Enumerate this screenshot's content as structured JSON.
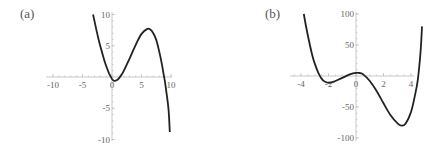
{
  "chart_data": [
    {
      "type": "line",
      "panel_label": "(a)",
      "title": "",
      "xlabel": "",
      "ylabel": "",
      "xlim": [
        -10,
        10
      ],
      "ylim": [
        -10,
        10
      ],
      "x_ticks": [
        -10,
        -5,
        0,
        5,
        10
      ],
      "x_tick_labels": [
        "-10",
        "-5",
        "0",
        "5",
        "10"
      ],
      "y_ticks": [
        -10,
        -5,
        5,
        10
      ],
      "y_tick_labels": [
        "-10",
        "-5",
        "5",
        "10"
      ],
      "grid": false,
      "description": "Cubic curve: decreasing from top-left, local min near (0.3, -0.6), local max near (6, 7.7), falling steeply to about -9 at x≈9.8",
      "series": [
        {
          "name": "f(x)",
          "x": [
            -3.2,
            -2.5,
            -2,
            -1.5,
            -1,
            -0.5,
            0,
            0.3,
            0.5,
            1,
            1.5,
            2,
            3,
            4,
            5,
            6,
            6.5,
            7,
            7.5,
            8,
            8.5,
            8.8,
            9,
            9.3,
            9.6,
            9.8
          ],
          "y": [
            10,
            6.9,
            5.0,
            3.3,
            1.8,
            0.6,
            -0.3,
            -0.6,
            -0.6,
            -0.4,
            0.2,
            1.0,
            3.0,
            5.1,
            6.9,
            7.7,
            7.6,
            7.0,
            5.9,
            4.1,
            1.8,
            0.2,
            -0.9,
            -3.0,
            -5.3,
            -8.8
          ]
        }
      ],
      "colors": {
        "curve": "#222222",
        "axis": "#bbbbbb",
        "label": "#666666"
      }
    },
    {
      "type": "line",
      "panel_label": "(b)",
      "title": "",
      "xlabel": "",
      "ylabel": "",
      "xlim": [
        -5,
        5
      ],
      "ylim": [
        -100,
        100
      ],
      "x_ticks": [
        -4,
        -2,
        0,
        2,
        4
      ],
      "x_tick_labels": [
        "-4",
        "-2",
        "0",
        "2",
        "4"
      ],
      "y_ticks": [
        -100,
        -50,
        50,
        100
      ],
      "y_tick_labels": [
        "-100",
        "-50",
        "50",
        "100"
      ],
      "grid": false,
      "description": "Quartic curve: falls from ~100 at x≈-3.8, local min near (-2, -11), local max near (0.2, 5), global min near (3.3, -80), rising to ~80 at x≈4.8",
      "series": [
        {
          "name": "g(x)",
          "x": [
            -3.8,
            -3.5,
            -3.2,
            -3.0,
            -2.7,
            -2.4,
            -2.0,
            -1.6,
            -1.2,
            -0.8,
            -0.4,
            0,
            0.2,
            0.5,
            1.0,
            1.5,
            2.0,
            2.5,
            3.0,
            3.3,
            3.6,
            4.0,
            4.3,
            4.5,
            4.7,
            4.8
          ],
          "y": [
            100,
            65,
            35,
            20,
            3,
            -7,
            -11,
            -9,
            -5,
            -1,
            3,
            5,
            5,
            3,
            -8,
            -24,
            -44,
            -63,
            -76,
            -80,
            -77,
            -58,
            -30,
            -5,
            40,
            80
          ]
        }
      ],
      "colors": {
        "curve": "#222222",
        "axis": "#bbbbbb",
        "label": "#666666"
      }
    }
  ]
}
